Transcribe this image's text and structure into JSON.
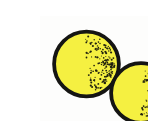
{
  "image": {
    "title": "Two yellow stippled spheres clip-art",
    "width": 148,
    "height": 121,
    "background_color": "#FDFDFC"
  },
  "spheres": [
    {
      "name": "back-sphere",
      "cx": 46.5,
      "cy": 48,
      "r": 32.4,
      "fill_color": "#F5F041",
      "outline_color": "#151513",
      "outline_width": 3.8,
      "stipple": {
        "color": "#21210F",
        "count": 170,
        "facing_deg": -4,
        "spread_deg": 88,
        "inner_frac": 0.12,
        "outer_frac": 0.93,
        "dot_r_min": 0.5,
        "dot_r_max": 1.1,
        "seed": 7
      }
    },
    {
      "name": "front-sphere",
      "cx": 101,
      "cy": 77,
      "r": 29.9,
      "fill_color": "#F5F041",
      "outline_color": "#151513",
      "outline_width": 3.8,
      "stipple": {
        "color": "#21210F",
        "count": 150,
        "facing_deg": 6,
        "spread_deg": 86,
        "inner_frac": 0.12,
        "outer_frac": 0.93,
        "dot_r_min": 0.5,
        "dot_r_max": 1.1,
        "seed": 21
      }
    }
  ],
  "smudge": {
    "cx": 116,
    "cy": 19,
    "rx": 4,
    "ry": 5,
    "color": "#ECECE8"
  }
}
